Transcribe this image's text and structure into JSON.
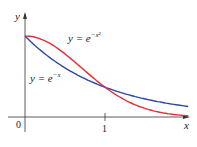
{
  "chart_data": {
    "type": "line",
    "title": "",
    "xlabel": "x",
    "ylabel": "y",
    "xlim": [
      0,
      2
    ],
    "ylim": [
      0,
      1.25
    ],
    "grid": false,
    "x_ticks": [
      "0",
      "1"
    ],
    "series": [
      {
        "name": "y = e^{-x^2}",
        "color": "#e0303a",
        "function": "exp(-x^2)",
        "x": [
          0,
          0.25,
          0.5,
          0.75,
          1,
          1.25,
          1.5,
          1.75,
          2
        ],
        "values": [
          1,
          0.939,
          0.779,
          0.57,
          0.368,
          0.21,
          0.105,
          0.047,
          0.018
        ]
      },
      {
        "name": "y = e^{-x}",
        "color": "#2b47a8",
        "function": "exp(-x)",
        "x": [
          0,
          0.25,
          0.5,
          0.75,
          1,
          1.25,
          1.5,
          1.75,
          2
        ],
        "values": [
          1,
          0.779,
          0.607,
          0.472,
          0.368,
          0.287,
          0.223,
          0.174,
          0.135
        ]
      }
    ],
    "annotations": [
      "y = e^{-x^2}",
      "y = e^{-x}"
    ],
    "intersection": {
      "x": 1,
      "y": 0.368
    }
  },
  "labels": {
    "y_axis": "y",
    "x_axis": "x",
    "origin": "0",
    "tick_1": "1",
    "red_base": "y = e",
    "red_exp": "−x²",
    "blue_base": "y = e",
    "blue_exp": "−x"
  }
}
